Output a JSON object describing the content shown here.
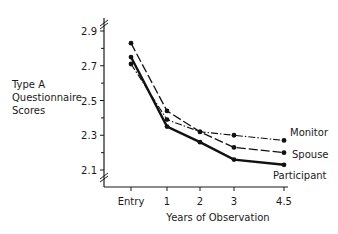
{
  "chart_data": {
    "type": "line",
    "title": "",
    "xlabel": "Years of Observation",
    "ylabel": "Type A Questionnaire Scores",
    "ylabel_lines": [
      "Type A",
      "Questionnaire",
      "Scores"
    ],
    "categories": [
      "Entry",
      "1",
      "2",
      "3",
      "4.5"
    ],
    "x": [
      0,
      1,
      2,
      3,
      4.5
    ],
    "y_ticks": [
      "2.9",
      "2.7",
      "2.5",
      "2.3",
      "2.1"
    ],
    "ylim": [
      2.0,
      2.95
    ],
    "grid": false,
    "legend_position": "inline-right",
    "series": [
      {
        "name": "Monitor",
        "style": "dash-dot",
        "values": [
          2.71,
          2.39,
          2.32,
          2.3,
          2.27
        ]
      },
      {
        "name": "Spouse",
        "style": "dashed",
        "values": [
          2.83,
          2.44,
          2.32,
          2.23,
          2.2
        ]
      },
      {
        "name": "Participant",
        "style": "solid-thick",
        "values": [
          2.75,
          2.35,
          2.26,
          2.16,
          2.13
        ]
      }
    ]
  }
}
